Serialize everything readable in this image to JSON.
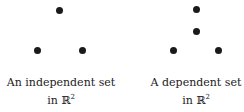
{
  "panels": [
    {
      "caption_line1": "An independent set",
      "caption_line2_prefix": "in ℝ",
      "caption_line2_sup": "2",
      "points": [
        [
          59,
          10
        ],
        [
          37,
          50
        ],
        [
          82,
          50
        ]
      ]
    },
    {
      "caption_line1": "A dependent set",
      "caption_line2_prefix": "in ℝ",
      "caption_line2_sup": "2",
      "points": [
        [
          196,
          9
        ],
        [
          196,
          31
        ],
        [
          173,
          50
        ],
        [
          218,
          50
        ]
      ]
    }
  ]
}
